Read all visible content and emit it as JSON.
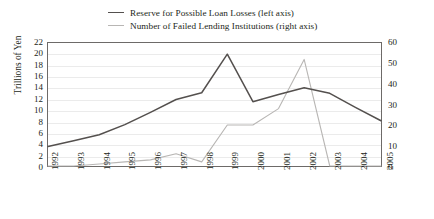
{
  "legend": {
    "position": "top-center",
    "items": [
      {
        "label": "Reserve for Possible Loan Losses (left axis)",
        "color": "#54504e",
        "axis": "left"
      },
      {
        "label": "Number of Failed Lending Institutions (right axis)",
        "color": "#b8b6b4",
        "axis": "right"
      }
    ]
  },
  "axes": {
    "y_left_title": "Trillions of Yen",
    "y_left_ticks": [
      "22",
      "20",
      "18",
      "16",
      "14",
      "12",
      "10",
      "8",
      "6",
      "4",
      "2",
      "0"
    ],
    "y_right_ticks": [
      "60",
      "50",
      "40",
      "30",
      "20",
      "10",
      "0"
    ],
    "x_ticks": [
      "1992",
      "1993",
      "1994",
      "1995",
      "1996",
      "1997",
      "1998",
      "1999",
      "2000",
      "2001",
      "2002",
      "2003",
      "2004",
      "2005"
    ]
  },
  "chart_data": {
    "type": "line",
    "title": "",
    "subtitle": "",
    "xlabel": "",
    "ylabel": "Trillions of Yen",
    "y2label": "",
    "grid": true,
    "legend_position": "top-center",
    "categories": [
      "1992",
      "1993",
      "1994",
      "1995",
      "1996",
      "1997",
      "1998",
      "1999",
      "2000",
      "2001",
      "2002",
      "2003",
      "2004",
      "2005"
    ],
    "ylim": [
      0,
      22
    ],
    "y2lim": [
      0,
      60
    ],
    "series": [
      {
        "name": "Reserve for Possible Loan Losses (left axis)",
        "axis": "left",
        "color": "#54504e",
        "units": "Trillions of Yen",
        "values": [
          3.5,
          4.5,
          5.6,
          7.4,
          9.6,
          11.9,
          13.1,
          20.0,
          11.5,
          12.8,
          14.0,
          13.0,
          10.5,
          8.1
        ]
      },
      {
        "name": "Number of Failed Lending Institutions (right axis)",
        "axis": "right",
        "color": "#b8b6b4",
        "units": "institutions",
        "values": [
          0,
          0,
          1,
          2,
          3,
          6,
          2,
          20,
          20,
          28,
          52,
          0,
          0,
          0
        ]
      }
    ]
  }
}
